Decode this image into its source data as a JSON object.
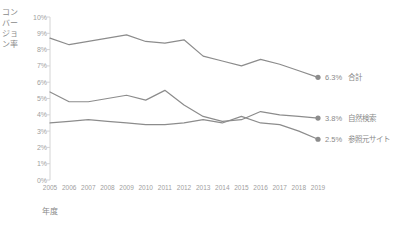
{
  "chart_data": {
    "type": "line",
    "title": "",
    "xlabel": "年度",
    "ylabel": "コンバージョン率",
    "categories": [
      "2005",
      "2006",
      "2007",
      "2008",
      "2009",
      "2010",
      "2011",
      "2012",
      "2013",
      "2014",
      "2015",
      "2016",
      "2017",
      "2018",
      "2019"
    ],
    "x": [
      2005,
      2006,
      2007,
      2008,
      2009,
      2010,
      2011,
      2012,
      2013,
      2014,
      2015,
      2016,
      2017,
      2018,
      2019
    ],
    "ylim": [
      0,
      10
    ],
    "xlim": [
      2005,
      2019
    ],
    "y_tick_labels": [
      "10%",
      "9%",
      "8%",
      "7%",
      "6%",
      "5%",
      "4%",
      "3%",
      "2%",
      "1%",
      "0%"
    ],
    "y_tick_values": [
      10,
      9,
      8,
      7,
      6,
      5,
      4,
      3,
      2,
      1,
      0
    ],
    "grid": true,
    "legend_position": "end-of-line",
    "series": [
      {
        "name": "合計",
        "end_value_label": "6.3%",
        "color": "#8c8c8c",
        "values": [
          8.7,
          8.3,
          8.5,
          8.7,
          8.9,
          8.5,
          8.4,
          8.6,
          7.6,
          7.3,
          7.0,
          7.4,
          7.1,
          6.7,
          6.3
        ]
      },
      {
        "name": "自然検索",
        "end_value_label": "3.8%",
        "color": "#8c8c8c",
        "values": [
          5.4,
          4.8,
          4.8,
          5.0,
          5.2,
          4.9,
          5.5,
          4.6,
          3.9,
          3.6,
          3.7,
          4.2,
          4.0,
          3.9,
          3.8
        ]
      },
      {
        "name": "参照元サイト",
        "end_value_label": "2.5%",
        "color": "#8c8c8c",
        "values": [
          3.5,
          3.6,
          3.7,
          3.6,
          3.5,
          3.4,
          3.4,
          3.5,
          3.7,
          3.5,
          3.9,
          3.5,
          3.4,
          3.0,
          2.5
        ]
      }
    ]
  }
}
